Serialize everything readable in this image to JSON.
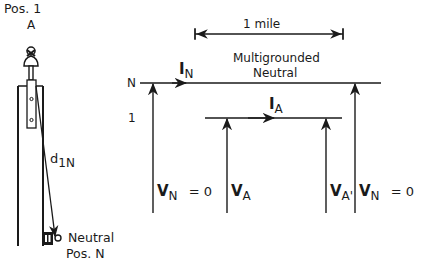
{
  "pole": {
    "top_label": "Pos.  1",
    "phase_label": "A",
    "distance_symbol": "d",
    "distance_sub": "1N",
    "neutral_label": "Neutral",
    "neutral_pos_label": "Pos.  N"
  },
  "line_diagram": {
    "span_label": "1  mile",
    "conductor_title_line1": "Multigrounded",
    "conductor_title_line2": "Neutral",
    "row_n_label": "N",
    "row_1_label": "1",
    "current_neutral": {
      "symbol": "I",
      "sub": "N"
    },
    "current_phase": {
      "symbol": "I",
      "sub": "A"
    },
    "voltages": [
      {
        "symbol": "V",
        "sub": "N",
        "suffix": "=  0"
      },
      {
        "symbol": "V",
        "sub": "A",
        "suffix": ""
      },
      {
        "symbol": "V",
        "sub": "A'",
        "suffix": ""
      },
      {
        "symbol": "V",
        "sub": "N",
        "suffix": "=  0"
      }
    ]
  },
  "colors": {
    "ink": "#1a1a1a",
    "background": "#ffffff"
  }
}
